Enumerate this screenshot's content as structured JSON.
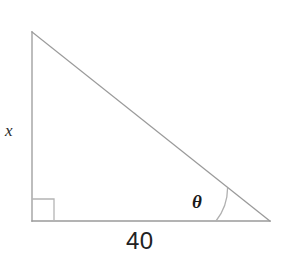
{
  "figure": {
    "type": "right-triangle-diagram",
    "background_color": "#ffffff",
    "stroke_color": "#9a9a9a",
    "stroke_width": 1.2,
    "labels": {
      "vertical_leg": "x",
      "horizontal_leg": "40",
      "angle": "θ"
    },
    "geometry": {
      "apex": {
        "x": 32,
        "y": 32
      },
      "right_angle_vertex": {
        "x": 32,
        "y": 221
      },
      "angle_vertex": {
        "x": 270,
        "y": 221
      },
      "right_angle_marker": {
        "x": 32,
        "y": 198,
        "size": 21
      },
      "angle_arc_radius": 54
    }
  }
}
